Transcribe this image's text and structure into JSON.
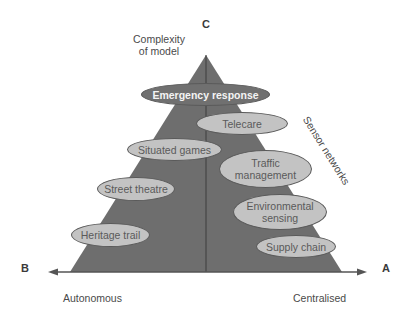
{
  "diagram": {
    "type": "triangle-taxonomy",
    "vertices": {
      "top": {
        "letter": "C",
        "label_line1": "Complexity",
        "label_line2": "of model"
      },
      "left": {
        "letter": "B",
        "label": "Autonomous"
      },
      "right": {
        "letter": "A",
        "label": "Centralised"
      }
    },
    "side_label": "Sensor networks",
    "nodes": [
      {
        "id": "emergency",
        "label": "Emergency response",
        "highlight": true
      },
      {
        "id": "telecare",
        "label": "Telecare"
      },
      {
        "id": "situated",
        "label": "Situated games"
      },
      {
        "id": "traffic",
        "line1": "Traffic",
        "line2": "management"
      },
      {
        "id": "street",
        "label": "Street theatre"
      },
      {
        "id": "environmental",
        "line1": "Environmental",
        "line2": "sensing"
      },
      {
        "id": "heritage",
        "label": "Heritage trail"
      },
      {
        "id": "supply",
        "label": "Supply chain"
      }
    ],
    "colors": {
      "triangle_fill": "#6e6e6e",
      "node_fill": "#c3c3c3",
      "node_highlight_fill": "#707070",
      "text": "#4a4a4a"
    }
  }
}
